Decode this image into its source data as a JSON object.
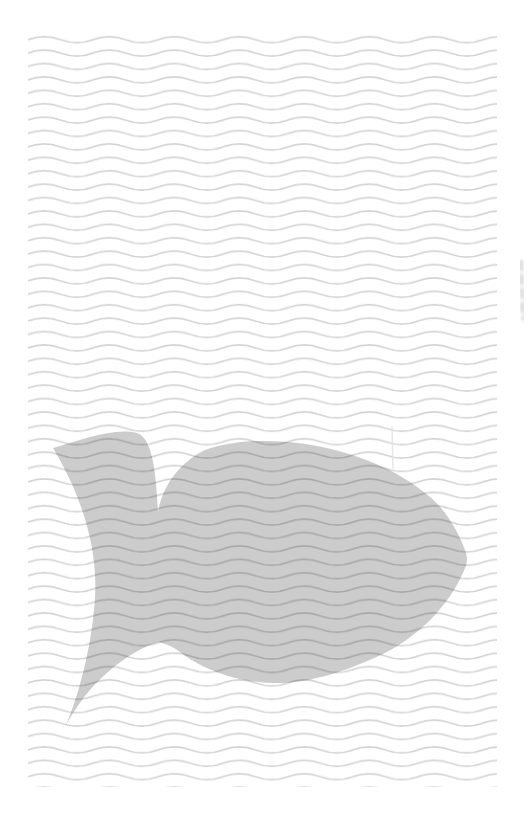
{
  "canvas": {
    "width": 531,
    "height": 829,
    "background": "#ffffff"
  },
  "pattern": {
    "name": "wavy-lines-paper",
    "color": "#d4d4d4",
    "stroke_width": 1.7,
    "tile_width": 65,
    "tile_height": 13.4,
    "tile_path": "M0,6.7 Q16.25,0.7 32.5,6.7 T65,6.7",
    "area": {
      "x": 28,
      "y": 33,
      "width": 469,
      "height": 754
    }
  },
  "fish": {
    "name": "fish-silhouette",
    "color": "#000000",
    "opacity": 0.2,
    "path": "M53,448 C80,440 115,427 137,433 C152,438 156,470 158,512 C162,490 175,465 205,450 C235,440 262,440 287,442 C330,445 390,462 430,497 C448,512 460,535 466,553 C468,559 467,565 463,573 C448,606 420,635 385,653 C350,670 310,684 272,683 C235,682 200,668 180,652 C172,646 166,644 158,642 C128,652 100,676 82,700 C74,711 67,722 63,732 C76,704 92,650 95,597 C98,545 80,493 53,448 Z"
  },
  "artifacts": {
    "edge_smudge": {
      "color": "#bdbdbd",
      "opacity": 0.5,
      "path": "M521,262 L523,318",
      "dash": "7 7",
      "width": 5
    },
    "scratch": {
      "color": "#e3e3e3",
      "opacity": 0.9,
      "path": "M392,427 L393,468",
      "width": 1.5
    }
  }
}
